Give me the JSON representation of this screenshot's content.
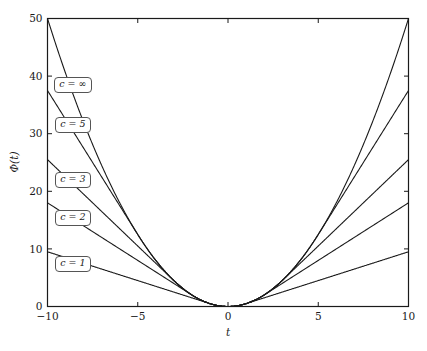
{
  "chart_data": {
    "type": "line",
    "title": "",
    "subtitle": "",
    "xlabel": "t",
    "ylabel": "Φ(t)",
    "xlim": [
      -10,
      10
    ],
    "ylim": [
      0,
      50
    ],
    "xticks": [
      -10,
      -5,
      0,
      5,
      10
    ],
    "xticklabels": [
      "−10",
      "−5",
      "0",
      "5",
      "10"
    ],
    "yticks": [
      0,
      10,
      20,
      30,
      40,
      50
    ],
    "yticklabels": [
      "0",
      "10",
      "20",
      "30",
      "40",
      "50"
    ],
    "grid": false,
    "legend_position": "inline-annotations",
    "line_color": "#1a1a1a",
    "series": [
      {
        "name": "c = 1",
        "c": 1,
        "label": "c = 1",
        "x": [
          -10,
          -9,
          -8,
          -7,
          -6,
          -5,
          -4,
          -3,
          -2,
          -1,
          -0.5,
          0,
          0.5,
          1,
          2,
          3,
          4,
          5,
          6,
          7,
          8,
          9,
          10
        ],
        "values": [
          9.5,
          8.5,
          7.5,
          6.5,
          5.5,
          4.5,
          3.5,
          2.5,
          1.5,
          0.5,
          0.125,
          0,
          0.125,
          0.5,
          1.5,
          2.5,
          3.5,
          4.5,
          5.5,
          6.5,
          7.5,
          8.5,
          9.5
        ]
      },
      {
        "name": "c = 2",
        "c": 2,
        "label": "c = 2",
        "x": [
          -10,
          -9,
          -8,
          -7,
          -6,
          -5,
          -4,
          -3,
          -2,
          -1.5,
          -1,
          -0.5,
          0,
          0.5,
          1,
          1.5,
          2,
          3,
          4,
          5,
          6,
          7,
          8,
          9,
          10
        ],
        "values": [
          18,
          16,
          14,
          12,
          10,
          8,
          6,
          4,
          2,
          1.125,
          0.5,
          0.125,
          0,
          0.125,
          0.5,
          1.125,
          2,
          4,
          6,
          8,
          10,
          12,
          14,
          16,
          18
        ]
      },
      {
        "name": "c = 3",
        "c": 3,
        "label": "c = 3",
        "x": [
          -10,
          -9,
          -8,
          -7,
          -6,
          -5,
          -4,
          -3,
          -2.5,
          -2,
          -1.5,
          -1,
          -0.5,
          0,
          0.5,
          1,
          1.5,
          2,
          2.5,
          3,
          4,
          5,
          6,
          7,
          8,
          9,
          10
        ],
        "values": [
          25.5,
          22.5,
          19.5,
          16.5,
          13.5,
          10.5,
          7.5,
          4.5,
          3.125,
          2,
          1.125,
          0.5,
          0.125,
          0,
          0.125,
          0.5,
          1.125,
          2,
          3.125,
          4.5,
          7.5,
          10.5,
          13.5,
          16.5,
          19.5,
          22.5,
          25.5
        ]
      },
      {
        "name": "c = 5",
        "c": 5,
        "label": "c = 5",
        "x": [
          -10,
          -9,
          -8,
          -7,
          -6,
          -5,
          -4,
          -3,
          -2,
          -1,
          0,
          1,
          2,
          3,
          4,
          5,
          6,
          7,
          8,
          9,
          10
        ],
        "values": [
          37.5,
          32.5,
          27.5,
          22.5,
          17.5,
          12.5,
          8,
          4.5,
          2,
          0.5,
          0,
          0.5,
          2,
          4.5,
          8,
          12.5,
          17.5,
          22.5,
          27.5,
          32.5,
          37.5
        ]
      },
      {
        "name": "c = ∞",
        "c": "∞",
        "label": "c = ∞",
        "x": [
          -10,
          -9,
          -8,
          -7,
          -6,
          -5,
          -4,
          -3,
          -2,
          -1,
          0,
          1,
          2,
          3,
          4,
          5,
          6,
          7,
          8,
          9,
          10
        ],
        "values": [
          50,
          40.5,
          32,
          24.5,
          18,
          12.5,
          8,
          4.5,
          2,
          0.5,
          0,
          0.5,
          2,
          4.5,
          8,
          12.5,
          18,
          24.5,
          32,
          40.5,
          50
        ]
      }
    ],
    "annotations": [
      {
        "text": "c = ∞",
        "x": -8.6,
        "y": 38.5
      },
      {
        "text": "c = 5",
        "x": -8.6,
        "y": 31.5
      },
      {
        "text": "c = 3",
        "x": -8.6,
        "y": 22.0
      },
      {
        "text": "c = 2",
        "x": -8.6,
        "y": 15.3
      },
      {
        "text": "c = 1",
        "x": -8.6,
        "y": 7.3
      }
    ]
  }
}
